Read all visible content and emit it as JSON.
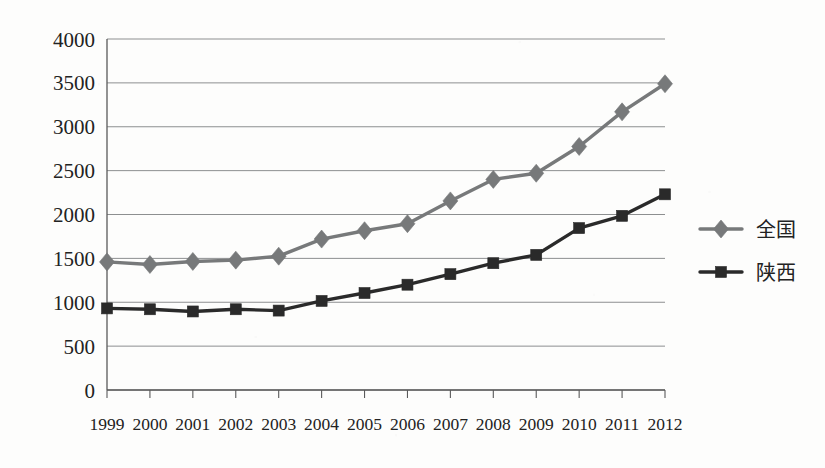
{
  "chart_data": {
    "type": "line",
    "title": "",
    "subtitle": "",
    "xlabel": "",
    "ylabel": "",
    "categories": [
      "1999",
      "2000",
      "2001",
      "2002",
      "2003",
      "2004",
      "2005",
      "2006",
      "2007",
      "2008",
      "2009",
      "2010",
      "2011",
      "2012"
    ],
    "x": [
      1999,
      2000,
      2001,
      2002,
      2003,
      2004,
      2005,
      2006,
      2007,
      2008,
      2009,
      2010,
      2011,
      2012
    ],
    "series": [
      {
        "name": "全国",
        "marker": "diamond",
        "color": "#77797a",
        "values": [
          1460,
          1430,
          1465,
          1480,
          1525,
          1720,
          1815,
          1895,
          2155,
          2400,
          2470,
          2775,
          3170,
          3490
        ]
      },
      {
        "name": "陕西",
        "marker": "square",
        "color": "#2a2a2a",
        "values": [
          930,
          920,
          895,
          920,
          905,
          1015,
          1105,
          1200,
          1320,
          1445,
          1540,
          1845,
          1985,
          2230
        ]
      }
    ],
    "ylim": [
      0,
      4000
    ],
    "yticks": [
      0,
      500,
      1000,
      1500,
      2000,
      2500,
      3000,
      3500,
      4000
    ],
    "ytick_labels": [
      "0",
      "500",
      "1000",
      "1500",
      "2000",
      "2500",
      "3000",
      "3500",
      "4000"
    ],
    "xlim": [
      1999,
      2012
    ],
    "grid": true,
    "grid_axis": "y",
    "legend_position": "right",
    "legend": [
      {
        "label": "全国",
        "marker": "diamond",
        "color": "#77797a"
      },
      {
        "label": "陕西",
        "marker": "square",
        "color": "#2a2a2a"
      }
    ]
  },
  "colors": {
    "background": "#fdfdfc",
    "axis": "#5a5a5a",
    "gridline": "#8d8f90",
    "text": "#222222",
    "series_national": "#77797a",
    "series_shaanxi": "#2a2a2a"
  },
  "plot_geometry": {
    "left": 107,
    "right": 665,
    "top": 39,
    "bottom": 390
  }
}
